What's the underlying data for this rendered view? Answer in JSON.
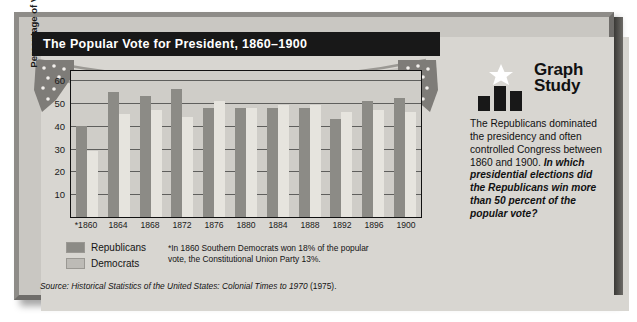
{
  "title": "The Popular Vote for President, 1860–1900",
  "chart_data": {
    "type": "bar",
    "title": "The Popular Vote for President, 1860–1900",
    "xlabel": "",
    "ylabel": "Percentage of Vote",
    "ylim": [
      0,
      64
    ],
    "yticks": [
      10,
      20,
      30,
      40,
      50,
      60
    ],
    "grid": true,
    "legend_position": "below-left",
    "categories": [
      "*1860",
      "1864",
      "1868",
      "1872",
      "1876",
      "1880",
      "1884",
      "1888",
      "1892",
      "1896",
      "1900"
    ],
    "series": [
      {
        "name": "Republicans",
        "color": "#8c8b86",
        "values": [
          40,
          55,
          53,
          56,
          48,
          48,
          48,
          48,
          43,
          51,
          52
        ]
      },
      {
        "name": "Democrats",
        "color": "#e6e4de",
        "values": [
          29,
          45,
          47,
          44,
          51,
          48,
          49,
          49,
          46,
          47,
          46
        ]
      }
    ],
    "footnote": "*In 1860 Southern Democrats won 18% of the popular vote, the Constitutional Union Party 13%.",
    "source": "Historical Statistics of the United States: Colonial Times to 1970 (1975)."
  },
  "axis": {
    "y_title": "Percentage of Vote",
    "y_ticks": [
      "60",
      "50",
      "40",
      "30",
      "20",
      "10"
    ],
    "x_ticks": [
      "*1860",
      "1864",
      "1868",
      "1872",
      "1876",
      "1880",
      "1884",
      "1888",
      "1892",
      "1896",
      "1900"
    ]
  },
  "legend": {
    "items": [
      {
        "label": "Republicans",
        "color": "#8c8b86"
      },
      {
        "label": "Democrats",
        "color": "#bdbbb6"
      }
    ]
  },
  "footnote": "*In 1860 Southern Democrats won 18% of the popular vote, the Constitutional Union Party 13%.",
  "source": {
    "label": "Source:",
    "title": "Historical Statistics of the United States: Colonial Times to 1970",
    "year": "(1975)."
  },
  "graph_study": {
    "heading_line1": "Graph",
    "heading_line2": "Study",
    "body": "The Republicans dominated the presidency and often controlled Congress between 1860 and 1900.",
    "question": "In which presidential elections did the Republicans win more than 50 percent of the popular vote?"
  }
}
